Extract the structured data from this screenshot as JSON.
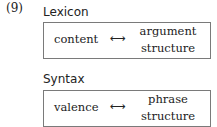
{
  "example_number": "(9)",
  "sections": [
    {
      "label": "Lexicon",
      "left": "content",
      "arrow": "⟷",
      "right_line1": "argument",
      "right_line2": "structure"
    },
    {
      "label": "Syntax",
      "left": "valence",
      "arrow": "⟷",
      "right_line1": "phrase",
      "right_line2": "structure"
    }
  ]
}
